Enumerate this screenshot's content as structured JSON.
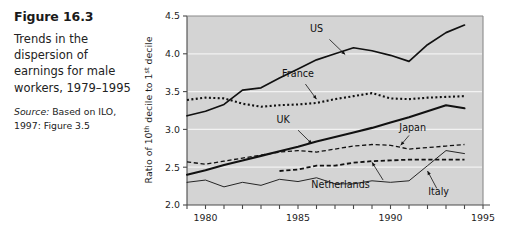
{
  "figure": {
    "number": "Figure 16.3",
    "caption": "Trends in the dispersion of earnings for male workers, 1979–1995",
    "source_label": "Source:",
    "source_text": " Based on ILO, 1997: Figure 3.5"
  },
  "chart_data": {
    "type": "line",
    "title": "Trends in the dispersion of earnings for male workers, 1979–1995",
    "xlabel": "",
    "ylabel": "Ratio of 10th decile to 1st decile",
    "ylabel_parts": {
      "a": "Ratio of 10",
      "sup1": "th",
      "b": " decile to 1",
      "sup2": "st",
      "c": " decile"
    },
    "xlim": [
      1979,
      1995
    ],
    "ylim": [
      2.0,
      4.5
    ],
    "yticks": [
      2.0,
      2.5,
      3.0,
      3.5,
      4.0,
      4.5
    ],
    "ytick_labels": [
      "2.0",
      "2.5",
      "3.0",
      "3.5",
      "4.0",
      "4.5"
    ],
    "xticks": [
      1979,
      1980,
      1981,
      1982,
      1983,
      1984,
      1985,
      1986,
      1987,
      1988,
      1989,
      1990,
      1991,
      1992,
      1993,
      1994,
      1995
    ],
    "xtick_labels_shown": [
      "1980",
      "1985",
      "1990",
      "1995"
    ],
    "xtick_labels_positions": [
      1980,
      1985,
      1990,
      1995
    ],
    "grid": "horizontal-white",
    "plot_background": "#d4d4d4",
    "legend_position": "inline-annotations",
    "series": [
      {
        "name": "US",
        "style": "solid",
        "width": 1.7,
        "color": "#111111",
        "x": [
          1979,
          1980,
          1981,
          1982,
          1983,
          1984,
          1985,
          1986,
          1987,
          1988,
          1989,
          1990,
          1991,
          1992,
          1993,
          1994
        ],
        "values": [
          3.18,
          3.24,
          3.33,
          3.52,
          3.55,
          3.68,
          3.8,
          3.92,
          4.0,
          4.08,
          4.04,
          3.98,
          3.9,
          4.12,
          4.28,
          4.38
        ]
      },
      {
        "name": "France",
        "style": "dotted",
        "width": 2.1,
        "color": "#111111",
        "x": [
          1979,
          1980,
          1981,
          1982,
          1983,
          1984,
          1985,
          1986,
          1987,
          1988,
          1989,
          1990,
          1991,
          1992,
          1993,
          1994
        ],
        "values": [
          3.39,
          3.42,
          3.41,
          3.34,
          3.3,
          3.32,
          3.33,
          3.35,
          3.4,
          3.44,
          3.48,
          3.41,
          3.4,
          3.42,
          3.43,
          3.44
        ]
      },
      {
        "name": "UK",
        "style": "solid",
        "width": 2.1,
        "color": "#111111",
        "x": [
          1979,
          1980,
          1981,
          1982,
          1983,
          1984,
          1985,
          1986,
          1987,
          1988,
          1989,
          1990,
          1991,
          1992,
          1993,
          1994
        ],
        "values": [
          2.4,
          2.46,
          2.53,
          2.59,
          2.65,
          2.71,
          2.77,
          2.84,
          2.9,
          2.96,
          3.02,
          3.09,
          3.16,
          3.24,
          3.32,
          3.28
        ]
      },
      {
        "name": "Japan",
        "style": "dashed",
        "width": 1.3,
        "color": "#111111",
        "x": [
          1979,
          1980,
          1981,
          1982,
          1983,
          1984,
          1985,
          1986,
          1987,
          1988,
          1989,
          1990,
          1991,
          1992,
          1993,
          1994
        ],
        "values": [
          2.57,
          2.54,
          2.58,
          2.62,
          2.66,
          2.7,
          2.72,
          2.7,
          2.74,
          2.78,
          2.8,
          2.79,
          2.74,
          2.76,
          2.78,
          2.8
        ]
      },
      {
        "name": "Netherlands",
        "style": "dashed",
        "width": 1.8,
        "color": "#111111",
        "x": [
          1984,
          1985,
          1986,
          1987,
          1988,
          1989,
          1990,
          1991,
          1992,
          1993,
          1994
        ],
        "values": [
          2.45,
          2.47,
          2.52,
          2.52,
          2.56,
          2.58,
          2.59,
          2.6,
          2.6,
          2.6,
          2.6
        ]
      },
      {
        "name": "Italy",
        "style": "solid",
        "width": 0.9,
        "color": "#111111",
        "x": [
          1979,
          1980,
          1981,
          1982,
          1983,
          1984,
          1985,
          1986,
          1987,
          1988,
          1989,
          1990,
          1991,
          1992,
          1993,
          1994
        ],
        "values": [
          2.3,
          2.33,
          2.24,
          2.3,
          2.26,
          2.34,
          2.31,
          2.36,
          2.28,
          2.28,
          2.32,
          2.3,
          2.32,
          2.52,
          2.72,
          2.68
        ]
      }
    ],
    "annotations": [
      {
        "label": "US",
        "x": 1986.0,
        "y": 4.29
      },
      {
        "label": "France",
        "x": 1985.0,
        "y": 3.69
      },
      {
        "label": "UK",
        "x": 1984.2,
        "y": 3.08
      },
      {
        "label": "Japan",
        "x": 1991.2,
        "y": 2.98
      },
      {
        "label": "Netherlands",
        "x": 1987.3,
        "y": 2.23
      },
      {
        "label": "Italy",
        "x": 1992.6,
        "y": 2.13
      }
    ]
  }
}
